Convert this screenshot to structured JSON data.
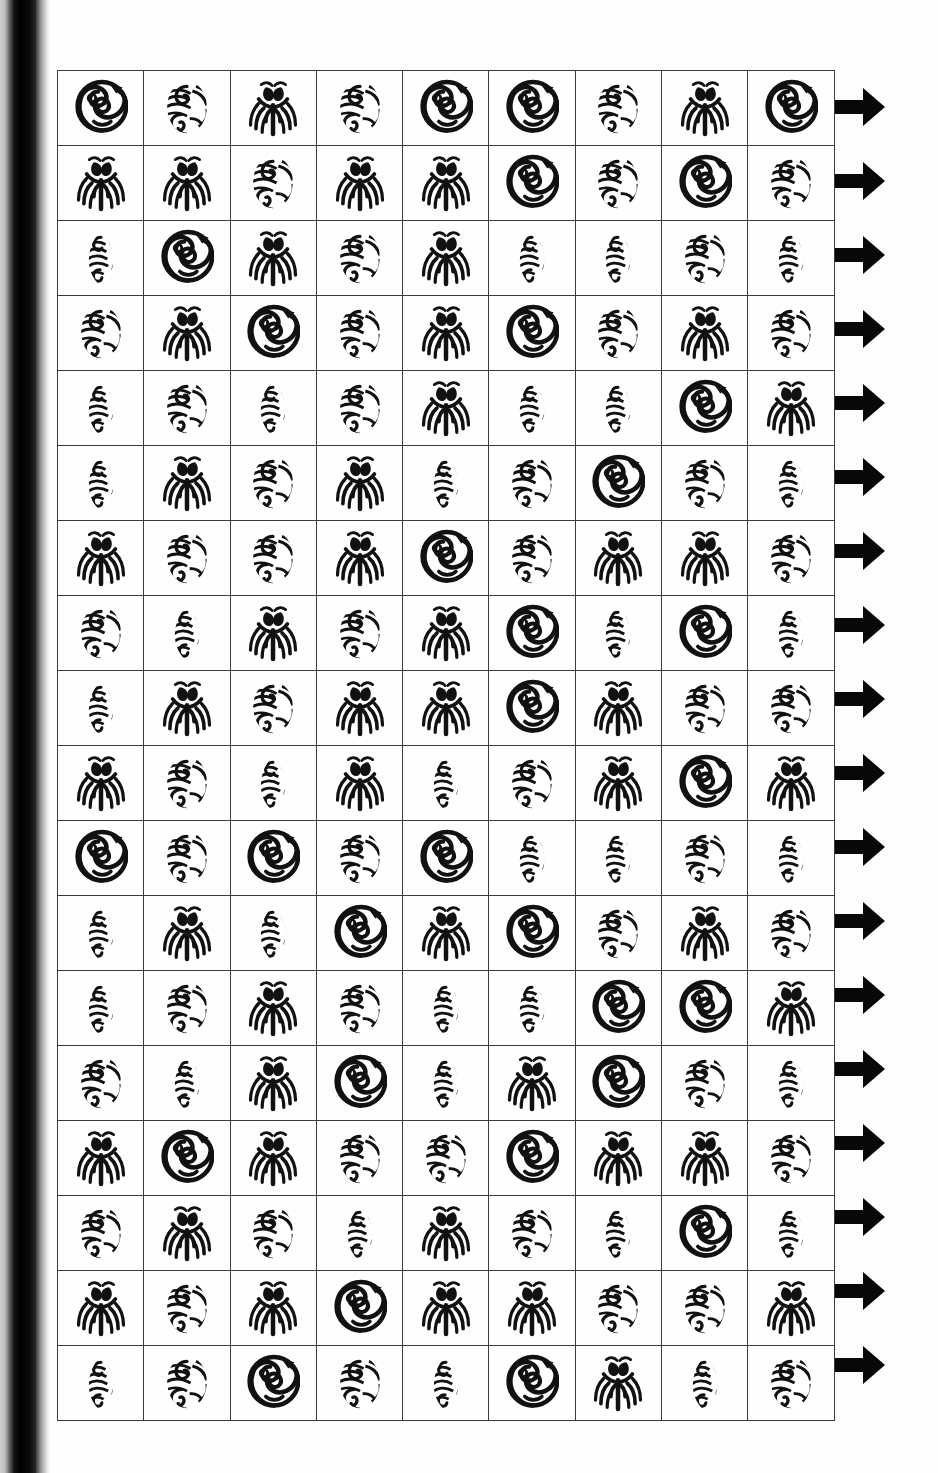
{
  "page": {
    "kind": "scanned-book-page",
    "background_color": "#fdfdfd",
    "spine_color": "#000000",
    "ink_color": "#111111",
    "grid_line_color": "#3b3b3b"
  },
  "legend": {
    "A": "spiral-koru-bird-circle",
    "B": "swirl-oval",
    "C": "two-eye-fern-face",
    "D": "pointed-leaf-spiral"
  },
  "grid": {
    "columns": 9,
    "rows": 18,
    "row_end_marker": "right-arrow",
    "cells": [
      [
        "A",
        "B",
        "C",
        "B",
        "A",
        "A",
        "B",
        "C",
        "A"
      ],
      [
        "C",
        "C",
        "B",
        "C",
        "C",
        "A",
        "B",
        "A",
        "B"
      ],
      [
        "D",
        "A",
        "C",
        "B",
        "C",
        "D",
        "D",
        "B",
        "D"
      ],
      [
        "B",
        "C",
        "A",
        "B",
        "C",
        "A",
        "B",
        "C",
        "B"
      ],
      [
        "D",
        "B",
        "D",
        "B",
        "C",
        "D",
        "D",
        "A",
        "C"
      ],
      [
        "D",
        "C",
        "B",
        "C",
        "D",
        "B",
        "A",
        "B",
        "D"
      ],
      [
        "C",
        "B",
        "B",
        "C",
        "A",
        "B",
        "C",
        "C",
        "B"
      ],
      [
        "B",
        "D",
        "C",
        "B",
        "C",
        "A",
        "D",
        "A",
        "D"
      ],
      [
        "D",
        "C",
        "B",
        "C",
        "C",
        "A",
        "C",
        "B",
        "B"
      ],
      [
        "C",
        "B",
        "D",
        "C",
        "D",
        "B",
        "C",
        "A",
        "C"
      ],
      [
        "A",
        "B",
        "A",
        "B",
        "A",
        "D",
        "D",
        "B",
        "D"
      ],
      [
        "D",
        "C",
        "D",
        "A",
        "C",
        "A",
        "B",
        "C",
        "B"
      ],
      [
        "D",
        "B",
        "C",
        "B",
        "D",
        "D",
        "A",
        "A",
        "C"
      ],
      [
        "B",
        "D",
        "C",
        "A",
        "D",
        "C",
        "A",
        "B",
        "D"
      ],
      [
        "C",
        "A",
        "C",
        "B",
        "B",
        "A",
        "C",
        "C",
        "B"
      ],
      [
        "B",
        "C",
        "B",
        "D",
        "C",
        "B",
        "D",
        "A",
        "D"
      ],
      [
        "C",
        "B",
        "C",
        "A",
        "C",
        "C",
        "B",
        "B",
        "C"
      ],
      [
        "D",
        "B",
        "A",
        "B",
        "D",
        "A",
        "C",
        "D",
        "B"
      ]
    ]
  }
}
